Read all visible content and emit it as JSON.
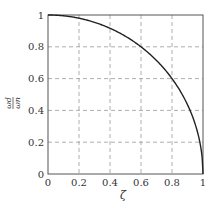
{
  "chart_data": {
    "type": "line",
    "title": "",
    "xlabel": "ζ",
    "ylabel": "ω_d / ω_n",
    "ylabel_parts": {
      "numerator": "ωd",
      "denominator": "ωn"
    },
    "xlim": [
      0,
      1
    ],
    "ylim": [
      0,
      1
    ],
    "xticks": [
      0,
      0.2,
      0.4,
      0.6,
      0.8,
      1
    ],
    "xtick_labels": [
      "0",
      "0.2",
      "0.4",
      "0.6",
      "0.8",
      "1"
    ],
    "yticks": [
      0,
      0.2,
      0.4,
      0.6,
      0.8,
      1
    ],
    "ytick_labels": [
      "0",
      "0.2",
      "0.4",
      "0.6",
      "0.8",
      "1"
    ],
    "grid": true,
    "grid_style": "dashed",
    "legend": null,
    "series": [
      {
        "name": "sqrt(1 - ζ²)",
        "x": [
          0,
          0.1,
          0.2,
          0.3,
          0.4,
          0.5,
          0.6,
          0.7,
          0.8,
          0.9,
          0.95,
          0.98,
          1.0
        ],
        "values": [
          1.0,
          0.995,
          0.98,
          0.954,
          0.917,
          0.866,
          0.8,
          0.714,
          0.6,
          0.436,
          0.312,
          0.199,
          0.0
        ],
        "color": "#222222"
      }
    ]
  },
  "colors": {
    "curve": "#222222",
    "axes": "#555555",
    "grid": "#999999"
  }
}
